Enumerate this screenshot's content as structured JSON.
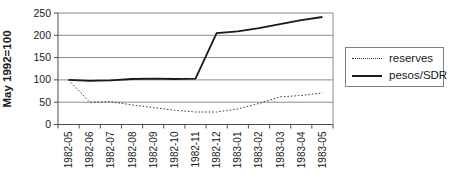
{
  "chart_data": {
    "type": "line",
    "title": "",
    "xlabel": "",
    "ylabel": "May 1992=100",
    "ylim": [
      0,
      250
    ],
    "yticks": [
      0,
      50,
      100,
      150,
      200,
      250
    ],
    "grid": true,
    "legend_position": "right",
    "categories": [
      "1982-05",
      "1982-06",
      "1982-07",
      "1982-08",
      "1982-09",
      "1982-10",
      "1982-11",
      "1982-12",
      "1983-01",
      "1983-02",
      "1983-03",
      "1983-04",
      "1983-05"
    ],
    "series": [
      {
        "name": "reserves",
        "style": "dotted",
        "color": "#333333",
        "values": [
          100,
          50,
          51,
          44,
          38,
          32,
          28,
          28,
          35,
          47,
          62,
          65,
          71
        ]
      },
      {
        "name": "pesos/SDR",
        "style": "solid",
        "color": "#1a1a1a",
        "values": [
          100,
          98,
          99,
          102,
          103,
          102,
          103,
          205,
          209,
          216,
          225,
          234,
          241
        ]
      }
    ],
    "colors": {
      "gridline": "#8c8c8c",
      "axis": "#4d4d4d",
      "tick_text": "#1a1a1a"
    }
  }
}
